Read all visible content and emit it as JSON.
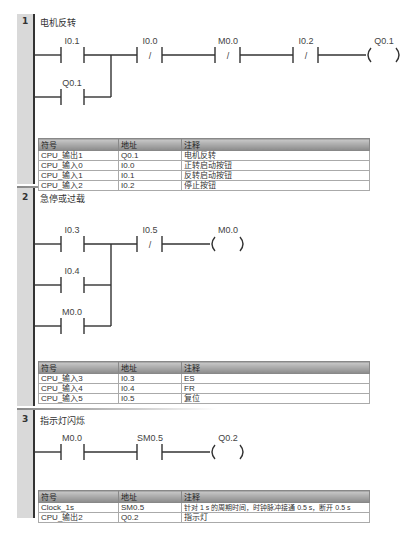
{
  "networks": [
    {
      "number": "1",
      "title": "电机反转",
      "elements": {
        "c1": "I0.1",
        "c2": "I0.0",
        "c3": "M0.0",
        "c4": "I0.2",
        "coil": "Q0.1",
        "branch": "Q0.1"
      },
      "symbol_table": {
        "headers": [
          "符号",
          "地址",
          "注释"
        ],
        "rows": [
          [
            "CPU_输出1",
            "Q0.1",
            "电机反转"
          ],
          [
            "CPU_输入0",
            "I0.0",
            "正转启动按钮"
          ],
          [
            "CPU_输入1",
            "I0.1",
            "反转启动按钮"
          ],
          [
            "CPU_输入2",
            "I0.2",
            "停止按钮"
          ]
        ]
      }
    },
    {
      "number": "2",
      "title": "急停或过载",
      "elements": {
        "c1": "I0.3",
        "c2": "I0.5",
        "coil": "M0.0",
        "branch1": "I0.4",
        "branch2": "M0.0"
      },
      "symbol_table": {
        "headers": [
          "符号",
          "地址",
          "注释"
        ],
        "rows": [
          [
            "CPU_输入3",
            "I0.3",
            "ES"
          ],
          [
            "CPU_输入4",
            "I0.4",
            "FR"
          ],
          [
            "CPU_输入5",
            "I0.5",
            "复位"
          ]
        ]
      }
    },
    {
      "number": "3",
      "title": "指示灯闪烁",
      "elements": {
        "c1": "M0.0",
        "c2": "SM0.5",
        "coil": "Q0.2"
      },
      "symbol_table": {
        "headers": [
          "符号",
          "地址",
          "注释"
        ],
        "rows": [
          [
            "Clock_1s",
            "SM0.5",
            "针对 1 s 的周期时间，时钟脉冲接通 0.5 s，断开 0.5 s"
          ],
          [
            "CPU_输出2",
            "Q0.2",
            "指示灯"
          ]
        ]
      }
    }
  ],
  "glyphs": {
    "nc_slash": "/",
    "coil_open": "(",
    "coil_close": ")"
  }
}
